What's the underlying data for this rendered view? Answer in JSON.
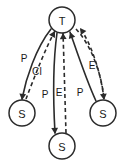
{
  "diagram": {
    "type": "directed-graph",
    "background_color": "#ffffff",
    "stroke_color": "#2b2b2b",
    "text_color": "#1a1a1a",
    "nodes": [
      {
        "id": "T",
        "label": "T",
        "cx": 62,
        "cy": 20,
        "r": 13
      },
      {
        "id": "S1",
        "label": "S",
        "cx": 22,
        "cy": 113,
        "r": 13
      },
      {
        "id": "S2",
        "label": "S",
        "cx": 62,
        "cy": 146,
        "r": 13
      },
      {
        "id": "S3",
        "label": "S",
        "cx": 103,
        "cy": 113,
        "r": 13
      }
    ],
    "edges": [
      {
        "id": "e1",
        "from": "T",
        "to": "S1",
        "style": "solid",
        "label": "P",
        "label_x": 24,
        "label_y": 58,
        "path": "M 51 29 C 36 48 26 78 22 99",
        "arrow_at": "end",
        "arrow_x": 22,
        "arrow_y": 100,
        "arrow_angle": 97
      },
      {
        "id": "e2",
        "from": "S1",
        "to": "T",
        "style": "dashed",
        "label": "CI",
        "label_x": 37,
        "label_y": 71,
        "path": "M 26 99 C 34 78 46 47 55 31",
        "arrow_at": "end",
        "arrow_x": 55,
        "arrow_y": 31,
        "arrow_angle": 299
      },
      {
        "id": "e3",
        "from": "T",
        "to": "S2",
        "style": "solid",
        "label": "P",
        "label_x": 45,
        "label_y": 94,
        "path": "M 57 33 C 53 62 53 98 55 133",
        "arrow_at": "end",
        "arrow_x": 55,
        "arrow_y": 134,
        "arrow_angle": 87
      },
      {
        "id": "e4",
        "from": "S2",
        "to": "T",
        "style": "dashed",
        "label": "E",
        "label_x": 59,
        "label_y": 92,
        "path": "M 66 133 C 65 100 64 62 63 33",
        "arrow_at": "end",
        "arrow_x": 63,
        "arrow_y": 33,
        "arrow_angle": 268
      },
      {
        "id": "e5",
        "from": "S3",
        "to": "T",
        "style": "solid",
        "label": "P",
        "label_x": 80,
        "label_y": 92,
        "path": "M 96 101 C 87 82 77 52 70 32",
        "arrow_at": "end",
        "arrow_x": 70,
        "arrow_y": 32,
        "arrow_angle": 251
      },
      {
        "id": "e6",
        "from": "T",
        "to": "S3",
        "style": "dashed",
        "label": "E",
        "label_x": 92,
        "label_y": 65,
        "path": "M 76 29 C 92 46 102 76 104 99",
        "arrow_at": "end",
        "arrow_x": 104,
        "arrow_y": 100,
        "arrow_angle": 84
      },
      {
        "id": "e7",
        "from": "S3",
        "to": "T",
        "style": "dashed",
        "label": "",
        "label_x": 0,
        "label_y": 0,
        "path": "M 104 99 C 101 74 92 45 80 28",
        "arrow_at": "end",
        "arrow_x": 80,
        "arrow_y": 28,
        "arrow_angle": 234
      }
    ]
  }
}
